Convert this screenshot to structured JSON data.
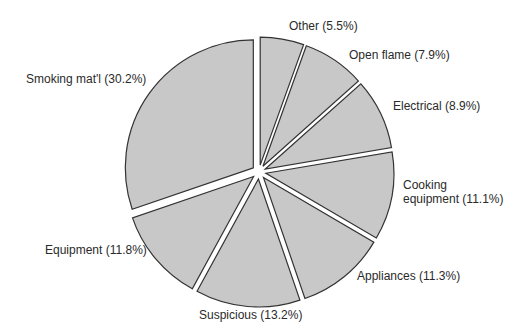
{
  "chart_data": {
    "type": "pie",
    "title": "",
    "slices": [
      {
        "label": "Other",
        "display": "Other (5.5%)",
        "value": 5.5
      },
      {
        "label": "Open flame",
        "display": "Open flame (7.9%)",
        "value": 7.9
      },
      {
        "label": "Electrical",
        "display": "Electrical (8.9%)",
        "value": 8.9
      },
      {
        "label": "Cooking equipment",
        "display_line1": "Cooking",
        "display_line2": "equipment (11.1%)",
        "value": 11.1
      },
      {
        "label": "Appliances",
        "display": "Appliances (11.3%)",
        "value": 11.3
      },
      {
        "label": "Suspicious",
        "display": "Suspicious (13.2%)",
        "value": 13.2
      },
      {
        "label": "Equipment",
        "display": "Equipment (11.8%)",
        "value": 11.8
      },
      {
        "label": "Smoking mat'l",
        "display": "Smoking mat'l (30.2%)",
        "value": 30.2
      }
    ],
    "start_angle_deg": 0,
    "direction": "clockwise",
    "exploded": true,
    "slice_fill": "#c8c8c8",
    "slice_stroke": "#333333",
    "legend": "none (labels adjacent to slices)"
  },
  "labels": {
    "other": "Other (5.5%)",
    "open_flame": "Open flame (7.9%)",
    "electrical": "Electrical (8.9%)",
    "cooking_1": "Cooking",
    "cooking_2": "equipment (11.1%)",
    "appliances": "Appliances (11.3%)",
    "suspicious": "Suspicious (13.2%)",
    "equipment": "Equipment (11.8%)",
    "smoking": "Smoking mat'l (30.2%)"
  }
}
